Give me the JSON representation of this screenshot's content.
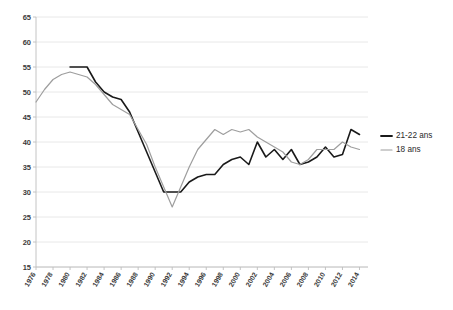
{
  "chart_data": {
    "type": "line",
    "title": "",
    "subtitle": "",
    "xlabel": "",
    "ylabel": "",
    "ylim": [
      15,
      65
    ],
    "ytick_step": 5,
    "yticks": [
      15,
      20,
      25,
      30,
      35,
      40,
      45,
      50,
      55,
      60,
      65
    ],
    "xlim": [
      1976,
      2015
    ],
    "xticks": [
      1976,
      1978,
      1980,
      1982,
      1984,
      1986,
      1988,
      1990,
      1992,
      1994,
      1996,
      1998,
      2000,
      2002,
      2004,
      2006,
      2008,
      2010,
      2012,
      2014
    ],
    "xtick_labels": [
      "1976",
      "1978",
      "1980",
      "1982",
      "1984",
      "1986",
      "1988",
      "1990",
      "1992",
      "1994",
      "1996",
      "1998",
      "2000",
      "2002",
      "2004",
      "2006",
      "2008",
      "2010",
      "2012",
      "2014"
    ],
    "grid": true,
    "grid_axis": "y",
    "legend_position": "right",
    "x": [
      1976,
      1977,
      1978,
      1979,
      1980,
      1981,
      1982,
      1983,
      1984,
      1985,
      1986,
      1987,
      1988,
      1989,
      1990,
      1991,
      1992,
      1993,
      1994,
      1995,
      1996,
      1997,
      1998,
      1999,
      2000,
      2001,
      2002,
      2003,
      2004,
      2005,
      2006,
      2007,
      2008,
      2009,
      2010,
      2011,
      2012,
      2013,
      2014
    ],
    "series": [
      {
        "name": "21-22 ans",
        "color": "#1a1a1a",
        "width": 1.6,
        "x": [
          1980,
          1981,
          1982,
          1983,
          1984,
          1985,
          1986,
          1987,
          1988,
          1989,
          1990,
          1991,
          1992,
          1993,
          1994,
          1995,
          1996,
          1997,
          1998,
          1999,
          2000,
          2001,
          2002,
          2003,
          2004,
          2005,
          2006,
          2007,
          2008,
          2009,
          2010,
          2011,
          2012,
          2013,
          2014
        ],
        "values": [
          55.0,
          55.0,
          55.0,
          52.0,
          50.0,
          49.0,
          48.5,
          46.0,
          42.0,
          38.0,
          34.0,
          30.0,
          30.0,
          30.0,
          32.0,
          33.0,
          33.5,
          33.5,
          35.5,
          36.5,
          37.0,
          35.5,
          40.0,
          37.0,
          38.5,
          36.5,
          38.5,
          35.5,
          36.0,
          37.0,
          39.0,
          37.0,
          37.5,
          42.5,
          41.5
        ]
      },
      {
        "name": "18 ans",
        "color": "#9e9e9e",
        "width": 1.2,
        "x": [
          1976,
          1977,
          1978,
          1979,
          1980,
          1981,
          1982,
          1983,
          1984,
          1985,
          1986,
          1987,
          1988,
          1989,
          1990,
          1991,
          1992,
          1993,
          1994,
          1995,
          1996,
          1997,
          1998,
          1999,
          2000,
          2001,
          2002,
          2003,
          2004,
          2005,
          2006,
          2007,
          2008,
          2009,
          2010,
          2011,
          2012,
          2013,
          2014
        ],
        "values": [
          48.0,
          50.5,
          52.5,
          53.5,
          54.0,
          53.5,
          53.0,
          51.5,
          49.5,
          47.5,
          46.5,
          45.5,
          42.5,
          39.5,
          35.0,
          31.0,
          27.0,
          31.0,
          35.0,
          38.5,
          40.5,
          42.5,
          41.5,
          42.5,
          42.0,
          42.5,
          41.0,
          40.0,
          39.0,
          38.0,
          36.0,
          35.5,
          36.5,
          38.5,
          38.5,
          38.5,
          40.0,
          39.0,
          38.5
        ]
      }
    ],
    "legend": [
      {
        "label": "21-22 ans",
        "color": "#1a1a1a",
        "width": 1.8
      },
      {
        "label": "18 ans",
        "color": "#9e9e9e",
        "width": 1.2
      }
    ]
  }
}
